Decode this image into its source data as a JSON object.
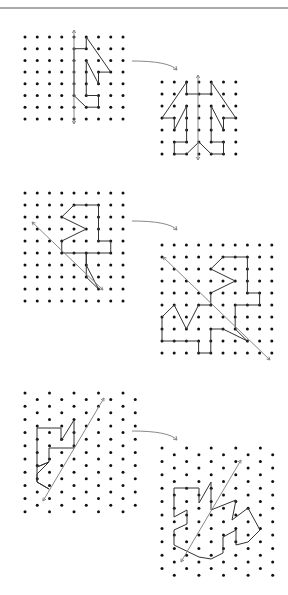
{
  "page": {
    "width": 288,
    "height": 595,
    "background": "#ffffff",
    "rule_y": 8,
    "colors": {
      "dot": "#111111",
      "shape": "#333333",
      "axis": "#888888",
      "rule": "#555555"
    }
  },
  "exercises": [
    {
      "label": "exercise-1",
      "source": {
        "grid": {
          "type": "square",
          "x0": 25,
          "y0": 37,
          "dx": 12.25,
          "dy": 11.7,
          "cols": 9,
          "rows": 8
        },
        "axis": [
          [
            74,
            30
          ],
          [
            74,
            124
          ]
        ],
        "shape": [
          [
            4,
            1
          ],
          [
            5,
            1
          ],
          [
            5,
            0
          ],
          [
            7,
            3
          ],
          [
            6,
            3
          ],
          [
            6,
            4
          ],
          [
            5,
            2
          ],
          [
            5,
            5
          ],
          [
            6,
            5
          ],
          [
            6,
            6
          ],
          [
            5,
            6
          ],
          [
            4,
            5
          ],
          [
            4,
            1
          ]
        ]
      },
      "target": {
        "grid": {
          "type": "square",
          "x0": 162,
          "y0": 82,
          "dx": 12.3,
          "dy": 12,
          "cols": 7,
          "rows": 7
        },
        "axis": [
          [
            198,
            75
          ],
          [
            198,
            160
          ]
        ],
        "shape": [
          [
            3,
            1
          ],
          [
            2,
            1
          ],
          [
            2,
            0
          ],
          [
            0,
            3
          ],
          [
            1,
            3
          ],
          [
            1,
            4
          ],
          [
            2,
            2
          ],
          [
            2,
            5
          ],
          [
            1,
            5
          ],
          [
            1,
            6
          ],
          [
            2,
            6
          ],
          [
            3,
            5
          ],
          [
            4,
            6
          ],
          [
            5,
            6
          ],
          [
            5,
            5
          ],
          [
            4,
            5
          ],
          [
            4,
            2
          ],
          [
            5,
            4
          ],
          [
            5,
            3
          ],
          [
            6,
            3
          ],
          [
            4,
            0
          ],
          [
            4,
            1
          ],
          [
            3,
            1
          ]
        ]
      },
      "arrow": {
        "from": [
          132,
          61
        ],
        "to": [
          177,
          70
        ]
      }
    },
    {
      "label": "exercise-2",
      "source": {
        "grid": {
          "type": "square",
          "x0": 25,
          "y0": 193,
          "dx": 12.25,
          "dy": 12,
          "cols": 9,
          "rows": 10
        },
        "axis": [
          [
            32,
            222
          ],
          [
            103,
            290
          ]
        ],
        "shape": [
          [
            4,
            1
          ],
          [
            6,
            1
          ],
          [
            6,
            4
          ],
          [
            7,
            4
          ],
          [
            7,
            5
          ],
          [
            5,
            5
          ],
          [
            5,
            6
          ],
          [
            6,
            8
          ],
          [
            5,
            7
          ],
          [
            5,
            5
          ],
          [
            4,
            5
          ],
          [
            3,
            5
          ],
          [
            3,
            4
          ],
          [
            5,
            3
          ],
          [
            3,
            2
          ],
          [
            4,
            1
          ]
        ]
      },
      "target": {
        "grid": {
          "type": "square",
          "x0": 162,
          "y0": 245,
          "dx": 12.2,
          "dy": 12,
          "cols": 10,
          "rows": 10
        },
        "axis": [
          [
            163,
            257
          ],
          [
            270,
            360
          ]
        ],
        "shape": [
          [
            6,
            1
          ],
          [
            7,
            1
          ],
          [
            7,
            4
          ],
          [
            8,
            4
          ],
          [
            8,
            5
          ],
          [
            6,
            5
          ],
          [
            6,
            7
          ],
          [
            7,
            8
          ],
          [
            5,
            7
          ],
          [
            4,
            7
          ],
          [
            4,
            9
          ],
          [
            3,
            9
          ],
          [
            3,
            8
          ],
          [
            0,
            8
          ],
          [
            0,
            6
          ],
          [
            1,
            5
          ],
          [
            2,
            7
          ],
          [
            3,
            5
          ],
          [
            4,
            5
          ],
          [
            4,
            4
          ],
          [
            6,
            3
          ],
          [
            4,
            2
          ],
          [
            5,
            1
          ],
          [
            6,
            1
          ]
        ]
      },
      "arrow": {
        "from": [
          132,
          221
        ],
        "to": [
          177,
          230
        ]
      }
    },
    {
      "label": "exercise-3",
      "source": {
        "grid": {
          "type": "staggered",
          "x0": 25,
          "y0": 393,
          "dx": 24.5,
          "offset": 12.25,
          "dy": 6.6,
          "rows": 19,
          "cols_even": 5,
          "cols_odd": 5
        },
        "axis": [
          [
            104,
            398
          ],
          [
            43,
            501
          ]
        ],
        "shape": [
          [
            37,
            428
          ],
          [
            61,
            428
          ],
          [
            61,
            441
          ],
          [
            74,
            420
          ],
          [
            74,
            448
          ],
          [
            74,
            441
          ],
          [
            61,
            441
          ]
        ],
        "polyline_px": [
          [
            37,
            428
          ],
          [
            61,
            428
          ],
          [
            61,
            441
          ],
          [
            74,
            420
          ],
          [
            74,
            448
          ],
          [
            74,
            448
          ],
          [
            49,
            448
          ],
          [
            49,
            462
          ],
          [
            37,
            467
          ],
          [
            49,
            462
          ],
          [
            37,
            474
          ],
          [
            37,
            482
          ],
          [
            49,
            489
          ],
          [
            37,
            482
          ],
          [
            37,
            428
          ]
        ]
      },
      "target": {
        "grid": {
          "type": "staggered",
          "x0": 162,
          "y0": 448,
          "dx": 24.6,
          "offset": 12.3,
          "dy": 6.7,
          "rows": 20,
          "cols_even": 5,
          "cols_odd": 5
        },
        "axis": [
          [
            241,
            460
          ],
          [
            181,
            562
          ]
        ],
        "polyline_px": [
          [
            174,
            488
          ],
          [
            199,
            488
          ],
          [
            199,
            503
          ],
          [
            211,
            482
          ],
          [
            211,
            510
          ],
          [
            236,
            500
          ],
          [
            232,
            520
          ],
          [
            248,
            508
          ],
          [
            260,
            530
          ],
          [
            248,
            542
          ],
          [
            236,
            545
          ],
          [
            236,
            530
          ],
          [
            223,
            537
          ],
          [
            223,
            553
          ],
          [
            211,
            559
          ],
          [
            199,
            557
          ],
          [
            174,
            545
          ],
          [
            174,
            530
          ],
          [
            187,
            524
          ],
          [
            187,
            510
          ],
          [
            174,
            517
          ],
          [
            174,
            488
          ]
        ]
      },
      "arrow": {
        "from": [
          132,
          431
        ],
        "to": [
          177,
          440
        ]
      }
    }
  ]
}
